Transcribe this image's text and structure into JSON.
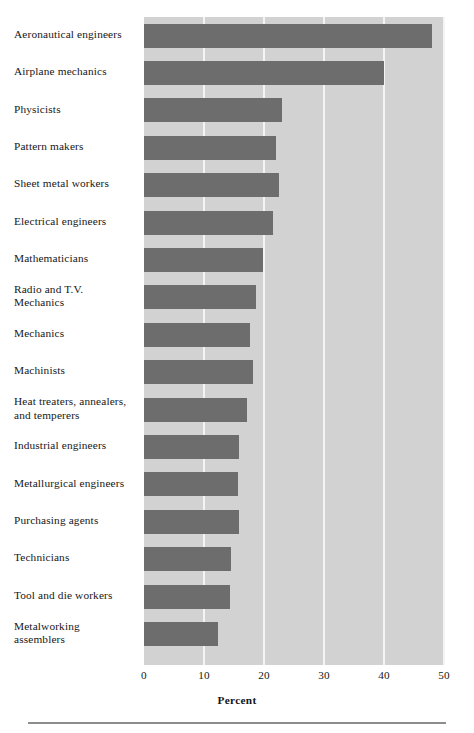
{
  "chart_data": {
    "type": "bar",
    "orientation": "horizontal",
    "title": "",
    "subtitle": "",
    "xlabel": "Percent",
    "ylabel": "",
    "xlim": [
      0,
      50
    ],
    "xticks": [
      0,
      10,
      20,
      30,
      40,
      50
    ],
    "xtick_labels": [
      "0",
      "10",
      "20",
      "30",
      "40",
      "50"
    ],
    "grid": "vertical",
    "legend": "none",
    "bar_color": "#6d6d6d",
    "plot_background_color": "#d2d2d2",
    "gridline_color": "#f4f4f4",
    "categories": [
      "Aeronautical engineers",
      "Airplane mechanics",
      "Physicists",
      "Pattern makers",
      "Sheet metal workers",
      "Electrical engineers",
      "Mathematicians",
      "Radio and T.V.\nMechanics",
      "Mechanics",
      "Machinists",
      "Heat treaters, annealers,\nand temperers",
      "Industrial engineers",
      "Metallurgical engineers",
      "Purchasing agents",
      "Technicians",
      "Tool and die workers",
      "Metalworking\nassemblers"
    ],
    "values": [
      48,
      40,
      23,
      22,
      22.5,
      21.5,
      19.8,
      18.7,
      17.7,
      18.1,
      17.2,
      15.8,
      15.7,
      15.8,
      14.5,
      14.3,
      12.3
    ]
  }
}
